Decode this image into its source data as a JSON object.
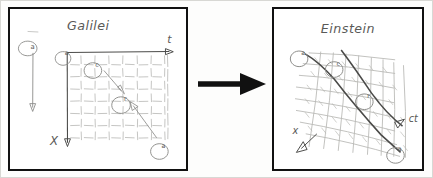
{
  "figure": {
    "kind": "hand-drawn-diagram",
    "background_color": "#ffffff",
    "ink_color": "#4a4a48",
    "frame_color": "#111111",
    "arrow_color": "#1a1a1a"
  },
  "left_panel": {
    "title": "Galilei",
    "axis_horizontal_label": "t",
    "axis_vertical_label": "X",
    "grid": {
      "style": "flat-rectangular",
      "columns": 7,
      "rows": 7
    },
    "markers": [
      {
        "id": "m-outside",
        "label": "a",
        "position": "outside-top-left"
      },
      {
        "id": "m-origin",
        "label": "a",
        "position": "grid-origin"
      },
      {
        "id": "m-upper",
        "label": "c",
        "position": "grid-upper-left"
      },
      {
        "id": "m-center",
        "label": "r",
        "position": "grid-center"
      },
      {
        "id": "m-lower",
        "label": "a",
        "position": "grid-lower-right"
      }
    ]
  },
  "right_panel": {
    "title": "Einstein",
    "axis_diagonal_label": "ct",
    "axis_vertical_label": "x",
    "grid": {
      "style": "warped-curved",
      "columns": 8,
      "rows": 8
    },
    "markers": [
      {
        "id": "e-top-left",
        "label": "a",
        "position": "upper-left"
      },
      {
        "id": "e-upper",
        "label": "c",
        "position": "upper-mid"
      },
      {
        "id": "e-center",
        "label": "r",
        "position": "center"
      },
      {
        "id": "e-lower",
        "label": "a",
        "position": "lower-right"
      }
    ],
    "worldlines": 2
  },
  "transition": {
    "arrow_icon": "right-arrow-icon",
    "direction": "left-to-right"
  }
}
